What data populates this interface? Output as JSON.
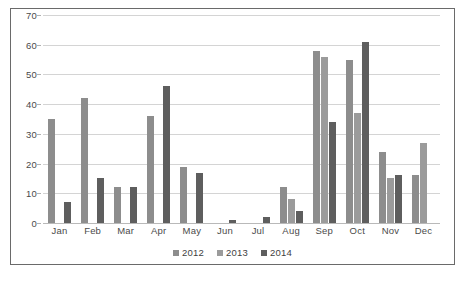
{
  "chart_data": {
    "type": "bar",
    "title": "",
    "xlabel": "",
    "ylabel": "",
    "ylim": [
      0,
      70
    ],
    "yticks": [
      0,
      10,
      20,
      30,
      40,
      50,
      60,
      70
    ],
    "grid": true,
    "legend_position": "bottom",
    "categories": [
      "Jan",
      "Feb",
      "Mar",
      "Apr",
      "May",
      "Jun",
      "Jul",
      "Aug",
      "Sep",
      "Oct",
      "Nov",
      "Dec"
    ],
    "series": [
      {
        "name": "2012",
        "color": "#8d8d8d",
        "values": [
          35,
          42,
          12,
          36,
          19,
          0,
          0,
          12,
          58,
          55,
          24,
          16
        ]
      },
      {
        "name": "2013",
        "color": "#9b9b9b",
        "values": [
          0,
          0,
          0,
          0,
          0,
          0,
          0,
          8,
          56,
          37,
          15,
          27
        ]
      },
      {
        "name": "2014",
        "color": "#5e5e5e",
        "values": [
          7,
          15,
          12,
          46,
          17,
          1,
          2,
          4,
          34,
          61,
          16,
          0
        ]
      }
    ]
  },
  "legend": {
    "items": [
      {
        "label": "2012",
        "swatch": "legend-swatch-2012"
      },
      {
        "label": "2013",
        "swatch": "legend-swatch-2013"
      },
      {
        "label": "2014",
        "swatch": "legend-swatch-2014"
      }
    ]
  },
  "colors": {
    "series_2012": "#8d8d8d",
    "series_2013": "#9b9b9b",
    "series_2014": "#5e5e5e",
    "gridline": "#d4d4d4",
    "border": "#6a6a6a",
    "text": "#4a4a4a",
    "background": "#ffffff"
  }
}
